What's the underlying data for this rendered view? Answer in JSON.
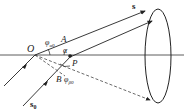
{
  "diagram": {
    "labels": {
      "O": "O",
      "A": "A",
      "P": "P",
      "B": "B",
      "alpha": "α",
      "phi_alpha0": "φα0",
      "phi_alpha0_sub": "α0",
      "phi_b0": "φ",
      "phi_b0_sub": "β0",
      "phi_main": "φ",
      "s": "s",
      "s0": "s",
      "s0_sub": "0"
    },
    "colors": {
      "stroke": "#222222",
      "background": "#ffffff"
    }
  }
}
